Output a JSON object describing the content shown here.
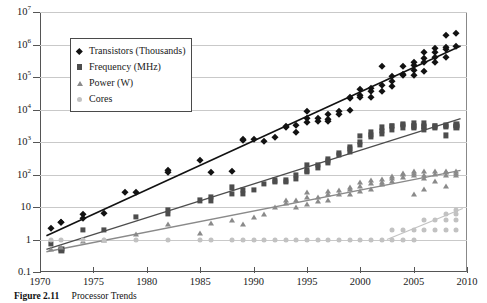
{
  "caption": {
    "number": "Figure 2.11",
    "text": "Processor Trends"
  },
  "legend": {
    "entries": [
      {
        "label": "Transistors (Thousands)",
        "marker": "diamond-marker",
        "color": "#121212"
      },
      {
        "label": "Frequency (MHz)",
        "marker": "square-marker",
        "color": "#4d4d4d"
      },
      {
        "label": "Power (W)",
        "marker": "triangle-marker",
        "color": "#8a8a8a"
      },
      {
        "label": "Cores",
        "marker": "circle-marker",
        "color": "#c2c2c2"
      }
    ]
  },
  "chart_data": {
    "type": "scatter",
    "title": "Processor Trends",
    "xlabel": "",
    "ylabel": "",
    "xlim": [
      1970,
      2010
    ],
    "ylim": [
      0.1,
      10000000
    ],
    "yscale": "log",
    "grid": true,
    "legend_position": "top-left",
    "xticks": [
      1970,
      1975,
      1980,
      1985,
      1990,
      1995,
      2000,
      2005,
      2010
    ],
    "xtick_labels": [
      "1970",
      "1975",
      "1980",
      "1985",
      "1990",
      "1995",
      "2000",
      "2005",
      "2010"
    ],
    "yticks": [
      0.1,
      1,
      10,
      100,
      1000,
      10000,
      100000,
      1000000,
      10000000
    ],
    "ytick_labels": [
      "0.1",
      "1",
      "10",
      "10^2",
      "10^3",
      "10^4",
      "10^5",
      "10^6",
      "10^7"
    ],
    "series": [
      {
        "name": "Transistors (Thousands)",
        "marker": "diamond",
        "color": "#121212",
        "trendline": {
          "x": [
            1970.6,
            2009.4
          ],
          "y": [
            1.3,
            900000
          ]
        },
        "points": [
          [
            1971,
            2.3
          ],
          [
            1972,
            3.5
          ],
          [
            1972,
            3.5
          ],
          [
            1974,
            6.0
          ],
          [
            1974,
            4.5
          ],
          [
            1976,
            6.5
          ],
          [
            1978,
            29
          ],
          [
            1979,
            29
          ],
          [
            1982,
            134
          ],
          [
            1982,
            120
          ],
          [
            1985,
            275
          ],
          [
            1986,
            120
          ],
          [
            1988,
            130
          ],
          [
            1989,
            1180
          ],
          [
            1989,
            1200
          ],
          [
            1990,
            1200
          ],
          [
            1991,
            1100
          ],
          [
            1992,
            1400
          ],
          [
            1993,
            3100
          ],
          [
            1993,
            2800
          ],
          [
            1994,
            2000
          ],
          [
            1994,
            3300
          ],
          [
            1995,
            5500
          ],
          [
            1995,
            4100
          ],
          [
            1995,
            9300
          ],
          [
            1996,
            5500
          ],
          [
            1996,
            4300
          ],
          [
            1997,
            7500
          ],
          [
            1997,
            5000
          ],
          [
            1997,
            4400
          ],
          [
            1998,
            7500
          ],
          [
            1998,
            9300
          ],
          [
            1999,
            9500
          ],
          [
            1999,
            22000
          ],
          [
            1999,
            24000
          ],
          [
            2000,
            28000
          ],
          [
            2000,
            42000
          ],
          [
            2000,
            25000
          ],
          [
            2001,
            45000
          ],
          [
            2001,
            37000
          ],
          [
            2001,
            25000
          ],
          [
            2002,
            55000
          ],
          [
            2002,
            220000
          ],
          [
            2002,
            37000
          ],
          [
            2003,
            54000
          ],
          [
            2003,
            105000
          ],
          [
            2003,
            77000
          ],
          [
            2004,
            125000
          ],
          [
            2004,
            112000
          ],
          [
            2004,
            220000
          ],
          [
            2005,
            230000
          ],
          [
            2005,
            112000
          ],
          [
            2005,
            169000
          ],
          [
            2005,
            291000
          ],
          [
            2006,
            151000
          ],
          [
            2006,
            291000
          ],
          [
            2006,
            376000
          ],
          [
            2006,
            582000
          ],
          [
            2007,
            582000
          ],
          [
            2007,
            411000
          ],
          [
            2007,
            291000
          ],
          [
            2007,
            789000
          ],
          [
            2008,
            731000
          ],
          [
            2008,
            410000
          ],
          [
            2008,
            820000
          ],
          [
            2008,
            1900000
          ],
          [
            2009,
            904000
          ],
          [
            2009,
            2300000
          ]
        ]
      },
      {
        "name": "Frequency (MHz)",
        "marker": "square",
        "color": "#4d4d4d",
        "trendline": {
          "x": [
            1970.6,
            2009.4
          ],
          "y": [
            0.5,
            5200
          ]
        },
        "points": [
          [
            1971,
            0.74
          ],
          [
            1972,
            0.5
          ],
          [
            1972,
            0.45
          ],
          [
            1974,
            2.0
          ],
          [
            1976,
            2.0
          ],
          [
            1979,
            5.0
          ],
          [
            1982,
            6.0
          ],
          [
            1982,
            8.0
          ],
          [
            1985,
            16
          ],
          [
            1986,
            16
          ],
          [
            1986,
            20
          ],
          [
            1988,
            25
          ],
          [
            1988,
            40
          ],
          [
            1989,
            25
          ],
          [
            1989,
            33
          ],
          [
            1990,
            33
          ],
          [
            1991,
            50
          ],
          [
            1992,
            66
          ],
          [
            1992,
            60
          ],
          [
            1993,
            60
          ],
          [
            1993,
            66
          ],
          [
            1994,
            75
          ],
          [
            1994,
            100
          ],
          [
            1995,
            133
          ],
          [
            1995,
            120
          ],
          [
            1995,
            200
          ],
          [
            1996,
            166
          ],
          [
            1996,
            200
          ],
          [
            1997,
            233
          ],
          [
            1997,
            300
          ],
          [
            1997,
            266
          ],
          [
            1998,
            450
          ],
          [
            1998,
            400
          ],
          [
            1999,
            600
          ],
          [
            1999,
            500
          ],
          [
            1999,
            700
          ],
          [
            2000,
            1000
          ],
          [
            2000,
            1500
          ],
          [
            2000,
            800
          ],
          [
            2001,
            1700
          ],
          [
            2001,
            1400
          ],
          [
            2001,
            2000
          ],
          [
            2002,
            2200
          ],
          [
            2002,
            2800
          ],
          [
            2002,
            1800
          ],
          [
            2003,
            3200
          ],
          [
            2003,
            2400
          ],
          [
            2003,
            3060
          ],
          [
            2004,
            3600
          ],
          [
            2004,
            3400
          ],
          [
            2004,
            2800
          ],
          [
            2005,
            3800
          ],
          [
            2005,
            3200
          ],
          [
            2005,
            2660
          ],
          [
            2005,
            3000
          ],
          [
            2006,
            2930
          ],
          [
            2006,
            3000
          ],
          [
            2006,
            2400
          ],
          [
            2006,
            3730
          ],
          [
            2007,
            3000
          ],
          [
            2007,
            2660
          ],
          [
            2007,
            3200
          ],
          [
            2008,
            3200
          ],
          [
            2008,
            2930
          ],
          [
            2008,
            3330
          ],
          [
            2008,
            1600
          ],
          [
            2009,
            3200
          ],
          [
            2009,
            2800
          ],
          [
            2009,
            3460
          ]
        ]
      },
      {
        "name": "Power (W)",
        "marker": "triangle",
        "color": "#8a8a8a",
        "trendline": {
          "x": [
            1970.6,
            2009.4
          ],
          "y": [
            0.42,
            135
          ]
        },
        "points": [
          [
            1971,
            0.5
          ],
          [
            1972,
            0.6
          ],
          [
            1974,
            0.9
          ],
          [
            1976,
            1.0
          ],
          [
            1979,
            1.5
          ],
          [
            1982,
            3.0
          ],
          [
            1985,
            1.6
          ],
          [
            1986,
            3.3
          ],
          [
            1988,
            4.0
          ],
          [
            1989,
            3.0
          ],
          [
            1990,
            5.0
          ],
          [
            1991,
            6.0
          ],
          [
            1992,
            10
          ],
          [
            1993,
            13
          ],
          [
            1993,
            16
          ],
          [
            1994,
            10
          ],
          [
            1994,
            16
          ],
          [
            1995,
            28
          ],
          [
            1995,
            20
          ],
          [
            1995,
            12
          ],
          [
            1996,
            20
          ],
          [
            1996,
            15
          ],
          [
            1997,
            30
          ],
          [
            1997,
            17
          ],
          [
            1997,
            25
          ],
          [
            1998,
            25
          ],
          [
            1998,
            33
          ],
          [
            1999,
            35
          ],
          [
            1999,
            25
          ],
          [
            1999,
            40
          ],
          [
            2000,
            45
          ],
          [
            2000,
            30
          ],
          [
            2000,
            60
          ],
          [
            2001,
            55
          ],
          [
            2001,
            70
          ],
          [
            2001,
            35
          ],
          [
            2002,
            75
          ],
          [
            2002,
            60
          ],
          [
            2002,
            50
          ],
          [
            2003,
            80
          ],
          [
            2003,
            65
          ],
          [
            2003,
            90
          ],
          [
            2004,
            103
          ],
          [
            2004,
            84
          ],
          [
            2004,
            115
          ],
          [
            2005,
            95
          ],
          [
            2005,
            130
          ],
          [
            2005,
            110
          ],
          [
            2005,
            26
          ],
          [
            2006,
            80
          ],
          [
            2006,
            125
          ],
          [
            2006,
            95
          ],
          [
            2006,
            35
          ],
          [
            2007,
            105
          ],
          [
            2007,
            130
          ],
          [
            2007,
            65
          ],
          [
            2008,
            95
          ],
          [
            2008,
            120
          ],
          [
            2008,
            130
          ],
          [
            2008,
            45
          ],
          [
            2009,
            95
          ],
          [
            2009,
            130
          ],
          [
            2009,
            110
          ]
        ]
      },
      {
        "name": "Cores",
        "marker": "circle",
        "color": "#c2c2c2",
        "trendline": {
          "x": [
            2002.5,
            2009.6
          ],
          "y": [
            1.0,
            9.0
          ]
        },
        "points": [
          [
            1971,
            1
          ],
          [
            1972,
            1
          ],
          [
            1974,
            1
          ],
          [
            1976,
            1
          ],
          [
            1979,
            1
          ],
          [
            1982,
            1
          ],
          [
            1985,
            1
          ],
          [
            1986,
            1
          ],
          [
            1988,
            1
          ],
          [
            1989,
            1
          ],
          [
            1990,
            1
          ],
          [
            1991,
            1
          ],
          [
            1992,
            1
          ],
          [
            1993,
            1
          ],
          [
            1994,
            1
          ],
          [
            1995,
            1
          ],
          [
            1996,
            1
          ],
          [
            1997,
            1
          ],
          [
            1998,
            1
          ],
          [
            1999,
            1
          ],
          [
            2000,
            1
          ],
          [
            2001,
            1
          ],
          [
            2002,
            1
          ],
          [
            2003,
            1
          ],
          [
            2003,
            2
          ],
          [
            2004,
            1
          ],
          [
            2004,
            2
          ],
          [
            2005,
            1
          ],
          [
            2005,
            2
          ],
          [
            2006,
            2
          ],
          [
            2006,
            4
          ],
          [
            2007,
            2
          ],
          [
            2007,
            4
          ],
          [
            2008,
            2
          ],
          [
            2008,
            4
          ],
          [
            2008,
            6
          ],
          [
            2009,
            4
          ],
          [
            2009,
            8
          ],
          [
            2009,
            6
          ],
          [
            2009,
            2
          ]
        ]
      }
    ]
  }
}
